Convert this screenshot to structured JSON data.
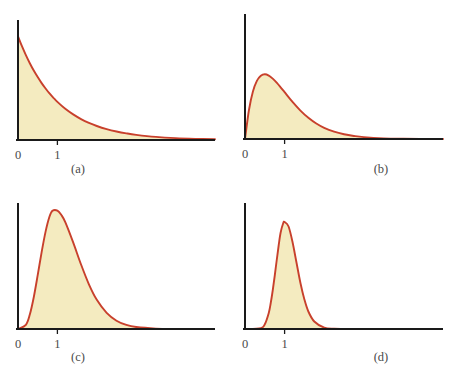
{
  "figure": {
    "background_color": "#ffffff",
    "curve_color": "#c8402c",
    "fill_color": "#f4ebc0",
    "axis_color": "#1a1a1a",
    "label_color": "#4a4a4a"
  },
  "chart_data": [
    {
      "type": "area",
      "title": "",
      "caption": "(a)",
      "xlabel": "",
      "ylabel": "",
      "grid": false,
      "legend": null,
      "xlim": [
        0,
        5
      ],
      "ylim": [
        0,
        1.1
      ],
      "xticks": [
        0,
        1
      ],
      "xticklabels": [
        "0",
        "1"
      ],
      "yticks": [],
      "yticklabels": [],
      "distribution": "gamma density, shape k = 1 (exponential), mean 1",
      "shape": 1,
      "mode": 0,
      "x": [
        0,
        0.1,
        0.2,
        0.3,
        0.4,
        0.5,
        0.6,
        0.7,
        0.8,
        0.9,
        1,
        1.2,
        1.4,
        1.6,
        1.8,
        2,
        2.25,
        2.5,
        2.75,
        3,
        3.5,
        4,
        4.5,
        5
      ],
      "y": [
        1,
        0.905,
        0.819,
        0.741,
        0.67,
        0.607,
        0.549,
        0.497,
        0.449,
        0.407,
        0.368,
        0.301,
        0.247,
        0.202,
        0.165,
        0.135,
        0.105,
        0.082,
        0.064,
        0.05,
        0.03,
        0.018,
        0.011,
        0.0067
      ]
    },
    {
      "type": "area",
      "title": "",
      "caption": "(b)",
      "xlabel": "",
      "ylabel": "",
      "grid": false,
      "legend": null,
      "xlim": [
        0,
        5
      ],
      "ylim": [
        0,
        1.1
      ],
      "xticks": [
        0,
        1
      ],
      "xticklabels": [
        "0",
        "1"
      ],
      "yticks": [],
      "yticklabels": [],
      "distribution": "gamma density, shape k = 2, mean 1",
      "shape": 2,
      "mode": 0.5,
      "x": [
        0,
        0.1,
        0.2,
        0.3,
        0.4,
        0.5,
        0.6,
        0.7,
        0.8,
        0.9,
        1,
        1.2,
        1.4,
        1.6,
        1.8,
        2,
        2.25,
        2.5,
        2.75,
        3,
        3.5,
        4,
        4.5,
        5
      ],
      "y": [
        0,
        0.268,
        0.439,
        0.537,
        0.584,
        0.598,
        0.586,
        0.558,
        0.521,
        0.478,
        0.433,
        0.343,
        0.263,
        0.196,
        0.143,
        0.103,
        0.068,
        0.044,
        0.028,
        0.017,
        0.0062,
        0.0022,
        0.00074,
        0.00024
      ]
    },
    {
      "type": "area",
      "title": "",
      "caption": "(c)",
      "xlabel": "",
      "ylabel": "",
      "grid": false,
      "legend": null,
      "xlim": [
        0,
        5
      ],
      "ylim": [
        0,
        1.3
      ],
      "xticks": [
        0,
        1
      ],
      "xticklabels": [
        "0",
        "1"
      ],
      "yticks": [],
      "yticklabels": [],
      "distribution": "gamma density, shape k = 8, mean 1",
      "shape": 8,
      "mode": 0.875,
      "x": [
        0,
        0.2,
        0.3,
        0.4,
        0.5,
        0.6,
        0.7,
        0.8,
        0.875,
        1,
        1.1,
        1.2,
        1.4,
        1.6,
        1.8,
        2,
        2.25,
        2.5,
        2.75,
        3,
        3.5,
        4
      ],
      "y": [
        0,
        0.045,
        0.156,
        0.344,
        0.583,
        0.833,
        1.055,
        1.218,
        1.28,
        1.282,
        1.235,
        1.157,
        0.938,
        0.699,
        0.484,
        0.316,
        0.175,
        0.09,
        0.044,
        0.021,
        0.0043,
        0.0008
      ]
    },
    {
      "type": "area",
      "title": "",
      "caption": "(d)",
      "xlabel": "",
      "ylabel": "",
      "grid": false,
      "legend": null,
      "xlim": [
        0,
        5
      ],
      "ylim": [
        0,
        2.4
      ],
      "xticks": [
        0,
        1
      ],
      "xticklabels": [
        "0",
        "1"
      ],
      "yticks": [],
      "yticklabels": [],
      "distribution": "gamma density, shape k = 30, mean 1",
      "shape": 30,
      "mode": 0.967,
      "x": [
        0,
        0.4,
        0.5,
        0.6,
        0.65,
        0.7,
        0.75,
        0.8,
        0.85,
        0.9,
        0.967,
        1,
        1.1,
        1.2,
        1.3,
        1.4,
        1.5,
        1.6,
        1.75,
        2,
        2.25,
        2.5,
        3
      ],
      "y": [
        0,
        0.018,
        0.095,
        0.322,
        0.52,
        0.77,
        1.06,
        1.37,
        1.67,
        1.93,
        2.12,
        2.14,
        2.05,
        1.74,
        1.33,
        0.92,
        0.59,
        0.35,
        0.15,
        0.027,
        0.0038,
        0.00044,
        4e-06
      ]
    }
  ]
}
